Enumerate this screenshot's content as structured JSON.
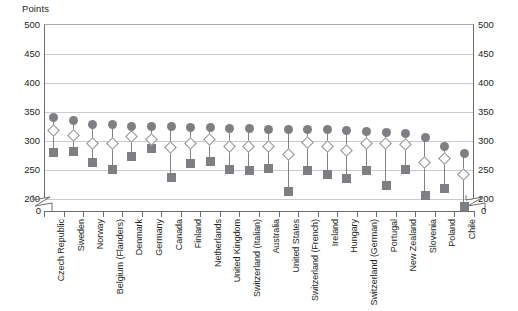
{
  "chart_data": {
    "type": "scatter",
    "title": "",
    "subtitle": "",
    "ylabel": "Points",
    "xlabel": "",
    "ylim": [
      200,
      500
    ],
    "y_axis_break": true,
    "y_axis_break_from": 0,
    "y_axis_break_to": 200,
    "yticks": [
      500,
      450,
      400,
      350,
      300,
      250,
      200
    ],
    "zero_tick": "0",
    "grid": true,
    "legend_position": "none",
    "dual_axis": true,
    "right_yticks": [
      500,
      450,
      400,
      350,
      300,
      250,
      200
    ],
    "right_zero_tick": "0",
    "categories": [
      "Czech Republic",
      "Sweden",
      "Norway",
      "Belgium (Flanders)",
      "Denmark",
      "Germany",
      "Canada",
      "Finland",
      "Netherlands",
      "United Kingdom",
      "Switzerland (Italian)",
      "Australia",
      "United States",
      "Switzerland (French)",
      "Ireland",
      "Hungary",
      "Switzerland (German)",
      "Portugal",
      "New Zealand",
      "Slovenia",
      "Poland",
      "Chile"
    ],
    "series": [
      {
        "name": "high",
        "marker": "filled-circle",
        "color": "#7d7f82",
        "values": [
          338,
          333,
          327,
          326,
          323,
          323,
          323,
          321,
          321,
          320,
          319,
          318,
          318,
          318,
          318,
          316,
          315,
          313,
          312,
          305,
          289,
          277
        ]
      },
      {
        "name": "median",
        "marker": "open-diamond",
        "color": "#ffffff",
        "border_color": "#8c8e90",
        "values": [
          316,
          308,
          293,
          293,
          305,
          300,
          287,
          293,
          301,
          288,
          288,
          288,
          274,
          296,
          288,
          281,
          293,
          294,
          291,
          260,
          267,
          240
        ]
      },
      {
        "name": "low",
        "marker": "filled-square",
        "color": "#7d7f82",
        "values": [
          279,
          281,
          261,
          250,
          272,
          285,
          236,
          260,
          263,
          249,
          247,
          251,
          212,
          247,
          240,
          234,
          248,
          222,
          250,
          205,
          217,
          185
        ]
      }
    ]
  },
  "axis": {
    "unit_caption": "Points"
  }
}
